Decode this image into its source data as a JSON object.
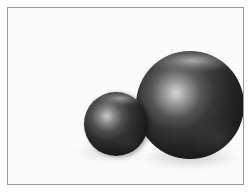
{
  "figure": {
    "caption": "",
    "background_color": "#ffffff",
    "frame": {
      "name": "image-border",
      "color": "#9a9a9a",
      "width_px": 1,
      "inset_px": 7
    },
    "objects": [
      {
        "id": "sphere-large",
        "label": "Large sphere",
        "shape": "sphere",
        "center_x": 182,
        "center_y": 97,
        "radius": 54,
        "base_color": "#232323",
        "highlight_color": "#e1e1e1",
        "specular_x_pct": 37,
        "specular_y_pct": 39,
        "rim_sheen": "top",
        "depth_order": "back"
      },
      {
        "id": "sphere-small",
        "label": "Small sphere",
        "shape": "sphere",
        "center_x": 108,
        "center_y": 116,
        "radius": 32,
        "base_color": "#222222",
        "highlight_color": "#d7d7d7",
        "specular_x_pct": 36,
        "specular_y_pct": 38,
        "rim_sheen": "top",
        "depth_order": "front"
      }
    ],
    "shadows": [
      {
        "id": "shadow-large",
        "label": "Large sphere ground shadow",
        "color": "#5a5a5a",
        "opacity": 0.32
      },
      {
        "id": "shadow-small",
        "label": "Small sphere ground shadow",
        "color": "#5f5f5f",
        "opacity": 0.26
      }
    ],
    "light": {
      "direction": "upper-left",
      "type": "specular-point"
    }
  }
}
